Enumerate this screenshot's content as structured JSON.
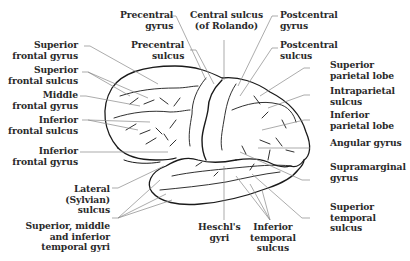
{
  "figure": {
    "colors": {
      "outline": "#1a1a1a",
      "leader": "#888888",
      "text": "#2a2a2a",
      "background": "#ffffff"
    }
  },
  "labels": {
    "precentral_gyrus": "Precentral\n    gyrus",
    "central_sulcus": "Central sulcus\n(of Rolando)",
    "postcentral_gyrus": "Postcentral\ngyrus",
    "precentral_sulcus": "Precentral\n    sulcus",
    "postcentral_sulcus": "Postcentral\nsulcus",
    "superior_frontal_gyrus": "Superior\nfrontal gyrus",
    "superior_frontal_sulcus": "Superior\nfrontal sulcus",
    "middle_frontal_gyrus": "Middle\nfrontal gyrus",
    "inferior_frontal_sulcus": "Inferior\nfrontal sulcus",
    "inferior_frontal_gyrus": "Inferior\nfrontal gyrus",
    "lateral_sulcus": "Lateral\n(Sylvian)\nsulcus",
    "temporal_gyri": "Superior, middle\nand inferior\ntemporal gyri",
    "heschls_gyri": "Heschl's\ngyri",
    "inferior_temporal_sulcus": "Inferior\ntemporal\nsulcus",
    "superior_parietal_lobe": "Superior\nparietal lobe",
    "intraparietal_sulcus": "Intraparietal\nsulcus",
    "inferior_parietal_lobe": "Inferior\nparietal lobe",
    "angular_gyrus": "Angular gyrus",
    "supramarginal_gyrus": "Supramarginal\ngyrus",
    "superior_temporal_sulcus": "Superior\ntemporal\nsulcus"
  }
}
